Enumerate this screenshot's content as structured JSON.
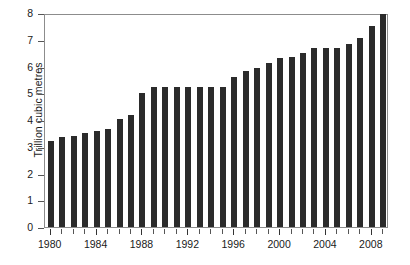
{
  "chart_data": {
    "type": "bar",
    "title": "",
    "subtitle": "",
    "xlabel": "",
    "ylabel": "Trillion cubic metres",
    "categories": [
      1980,
      1981,
      1982,
      1983,
      1984,
      1985,
      1986,
      1987,
      1988,
      1989,
      1990,
      1991,
      1992,
      1993,
      1994,
      1995,
      1996,
      1997,
      1998,
      1999,
      2000,
      2001,
      2002,
      2003,
      2004,
      2005,
      2006,
      2007,
      2008,
      2009
    ],
    "values": [
      3.2,
      3.35,
      3.42,
      3.52,
      3.6,
      3.68,
      4.02,
      4.18,
      5.0,
      5.22,
      5.22,
      5.22,
      5.22,
      5.22,
      5.25,
      5.25,
      5.6,
      5.82,
      5.95,
      6.12,
      6.3,
      6.35,
      6.5,
      6.7,
      6.7,
      6.7,
      6.85,
      7.05,
      7.5,
      7.95
    ],
    "ylim": [
      0,
      8
    ],
    "ytick_values": [
      0,
      1,
      2,
      3,
      4,
      5,
      6,
      7,
      8
    ],
    "ytick_labels": [
      "0",
      "1",
      "2",
      "3",
      "4",
      "5",
      "6",
      "7",
      "8"
    ],
    "xtick_label_years": [
      1980,
      1984,
      1988,
      1992,
      1996,
      2000,
      2004,
      2008
    ],
    "xtick_labels": [
      "1980",
      "1984",
      "1988",
      "1992",
      "1996",
      "2000",
      "2004",
      "2008"
    ],
    "grid": false,
    "legend": null,
    "legend_position": "none",
    "bar_color": "#2b2b2b",
    "frame_color": "#8c8c8c",
    "background_color": "#ffffff",
    "annotations": []
  }
}
